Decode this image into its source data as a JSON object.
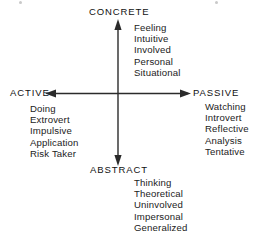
{
  "diagram": {
    "background_color": "#ffffff",
    "line_color": "#2b2b2b",
    "text_color": "#1a1a1a",
    "axes": {
      "vertical": {
        "top_pole": "CONCRETE",
        "bottom_pole": "ABSTRACT",
        "x": 118,
        "top_y": 22,
        "bottom_y": 163
      },
      "horizontal": {
        "left_pole": "ACTIVE",
        "right_pole": "PASSIVE",
        "y": 94,
        "left_x": 48,
        "right_x": 188
      }
    },
    "quadrants": {
      "concrete_passive": {
        "words": [
          "Feeling",
          "Intuitive",
          "Involved",
          "Personal",
          "Situational"
        ]
      },
      "concrete_active": {
        "words": [
          "Doing",
          "Extrovert",
          "Impulsive",
          "Application",
          "Risk Taker"
        ]
      },
      "abstract_passive": {
        "words": [
          "Watching",
          "Introvert",
          "Reflective",
          "Analysis",
          "Tentative"
        ]
      },
      "abstract_bottom": {
        "words": [
          "Thinking",
          "Theoretical",
          "Uninvolved",
          "Impersonal",
          "Generalized"
        ]
      }
    }
  }
}
